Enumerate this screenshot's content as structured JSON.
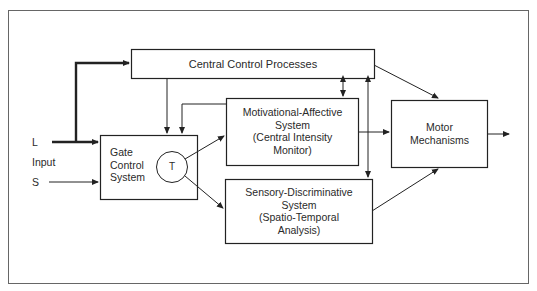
{
  "diagram": {
    "inputs": {
      "large_fiber": "L",
      "input_label": "Input",
      "small_fiber": "S"
    },
    "nodes": {
      "central_control": {
        "label": "Central Control Processes"
      },
      "gate_control": {
        "line1": "Gate",
        "line2": "Control",
        "line3": "System"
      },
      "transmission": {
        "label": "T"
      },
      "motivational": {
        "line1": "Motivational-Affective",
        "line2": "System",
        "line3": "(Central Intensity",
        "line4": "Monitor)"
      },
      "sensory": {
        "line1": "Sensory-Discriminative",
        "line2": "System",
        "line3": "(Spatio-Temporal",
        "line4": "Analysis)"
      },
      "motor": {
        "line1": "Motor",
        "line2": "Mechanisms"
      }
    },
    "edges": [
      {
        "from": "L",
        "to": "central_control",
        "style": "thick"
      },
      {
        "from": "L",
        "to": "gate_control",
        "style": "thick"
      },
      {
        "from": "S",
        "to": "gate_control",
        "style": "thin"
      },
      {
        "from": "central_control",
        "to": "gate_control"
      },
      {
        "from": "motivational",
        "to": "gate_control"
      },
      {
        "from": "transmission",
        "to": "motivational"
      },
      {
        "from": "transmission",
        "to": "sensory"
      },
      {
        "from": "central_control",
        "to": "motivational",
        "bidirectional": true
      },
      {
        "from": "central_control",
        "to": "sensory",
        "bidirectional": true
      },
      {
        "from": "central_control",
        "to": "motor"
      },
      {
        "from": "motivational",
        "to": "motor"
      },
      {
        "from": "sensory",
        "to": "motor"
      },
      {
        "from": "motor",
        "to": "output"
      }
    ]
  }
}
